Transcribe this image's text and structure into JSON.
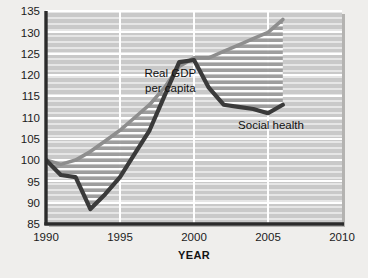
{
  "chart_data": {
    "type": "line",
    "title": "",
    "xlabel": "YEAR",
    "ylabel": "",
    "xlim": [
      1990,
      2010
    ],
    "ylim": [
      85,
      135
    ],
    "xticks": [
      1990,
      1995,
      2000,
      2005,
      2010
    ],
    "yticks": [
      85,
      90,
      95,
      100,
      105,
      110,
      115,
      120,
      125,
      130,
      135
    ],
    "grid": true,
    "grid_style": "horizontal white hatch lines on gray panel, vertical white lines at major x ticks",
    "legend_position": "inline annotations on plot",
    "annotations": [
      {
        "text": "Real GDP",
        "x": 1998.4,
        "y": 119.6
      },
      {
        "text": "per capita",
        "x": 1998.4,
        "y": 116.0
      },
      {
        "text": "Social health",
        "x": 2005.2,
        "y": 107.4
      }
    ],
    "series": [
      {
        "name": "Real GDP per capita",
        "color": "#8e8e8e",
        "x": [
          1990,
          1991,
          1992,
          1993,
          1994,
          1995,
          1996,
          1997,
          1998,
          1999,
          2000,
          2001,
          2002,
          2003,
          2004,
          2005,
          2006
        ],
        "values": [
          100,
          99,
          100,
          102,
          104.5,
          107,
          110,
          113,
          117,
          122,
          124,
          124,
          125.5,
          127,
          128.5,
          130,
          133
        ]
      },
      {
        "name": "Social health",
        "color": "#3a3a3a",
        "x": [
          1990,
          1991,
          1992,
          1993,
          1994,
          1995,
          1996,
          1997,
          1998,
          1999,
          2000,
          2001,
          2002,
          2003,
          2004,
          2005,
          2006
        ],
        "values": [
          100,
          96.5,
          96,
          88.5,
          92,
          96,
          101.5,
          107,
          115,
          123,
          123.5,
          117,
          113,
          112.5,
          112,
          111,
          113
        ]
      }
    ],
    "fill_between": {
      "label": "hatched gap between Real GDP per capita and Social health",
      "pattern": "horizontal white stripes over gray"
    }
  },
  "axis": {
    "x_title": "YEAR",
    "y_title": ""
  },
  "colors": {
    "page_background": "#efeeec",
    "panel_background": "#c9c9c9",
    "gridline": "#ffffff",
    "axis": "#2b2b2b",
    "gdp_line": "#8e8e8e",
    "social_health_line": "#3a3a3a",
    "text": "#1b1b1b"
  }
}
